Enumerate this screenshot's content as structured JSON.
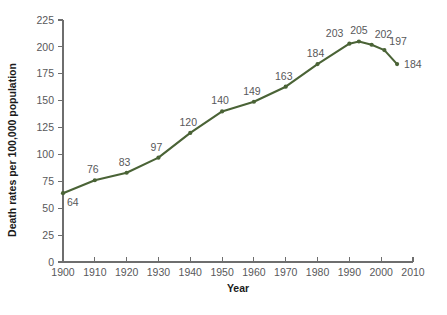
{
  "chart_data": {
    "type": "line",
    "title": "",
    "xlabel": "Year",
    "ylabel": "Death rates per 100,000 population",
    "xlim": [
      1900,
      2010
    ],
    "ylim": [
      0,
      225
    ],
    "grid": false,
    "legend": "none",
    "line_color": "#4a6336",
    "axis_color": "#6e6e6e",
    "label_color": "#58585a",
    "x_ticks": [
      1900,
      1910,
      1920,
      1930,
      1940,
      1950,
      1960,
      1970,
      1980,
      1990,
      2000,
      2010
    ],
    "x_tick_labels": [
      "1900",
      "1910",
      "1920",
      "1930",
      "1940",
      "1950",
      "1960",
      "1970",
      "1980",
      "1990",
      "2000",
      "2010"
    ],
    "y_ticks": [
      0,
      25,
      50,
      75,
      100,
      125,
      150,
      175,
      200,
      225
    ],
    "y_tick_labels": [
      "0",
      "25",
      "50",
      "75",
      "100",
      "125",
      "150",
      "175",
      "200",
      "225"
    ],
    "x": [
      1900,
      1910,
      1920,
      1930,
      1940,
      1950,
      1960,
      1970,
      1980,
      1990,
      1993,
      1997,
      2001,
      2005
    ],
    "values": [
      64,
      76,
      83,
      97,
      120,
      140,
      149,
      163,
      184,
      203,
      205,
      202,
      197,
      184
    ],
    "point_labels": [
      "64",
      "76",
      "83",
      "97",
      "120",
      "140",
      "149",
      "163",
      "184",
      "203",
      "205",
      "202",
      "197",
      "184"
    ],
    "label_offsets": [
      {
        "dx": 4,
        "dy": 13
      },
      {
        "dx": -2,
        "dy": -7
      },
      {
        "dx": -2,
        "dy": -7
      },
      {
        "dx": -2,
        "dy": -7
      },
      {
        "dx": -2,
        "dy": -7
      },
      {
        "dx": -2,
        "dy": -7
      },
      {
        "dx": -2,
        "dy": -7
      },
      {
        "dx": -2,
        "dy": -7
      },
      {
        "dx": -2,
        "dy": -7
      },
      {
        "dx": -6,
        "dy": -7
      },
      {
        "dx": 0,
        "dy": -8
      },
      {
        "dx": 3,
        "dy": -7
      },
      {
        "dx": 5,
        "dy": -5
      },
      {
        "dx": 7,
        "dy": 4
      }
    ]
  }
}
